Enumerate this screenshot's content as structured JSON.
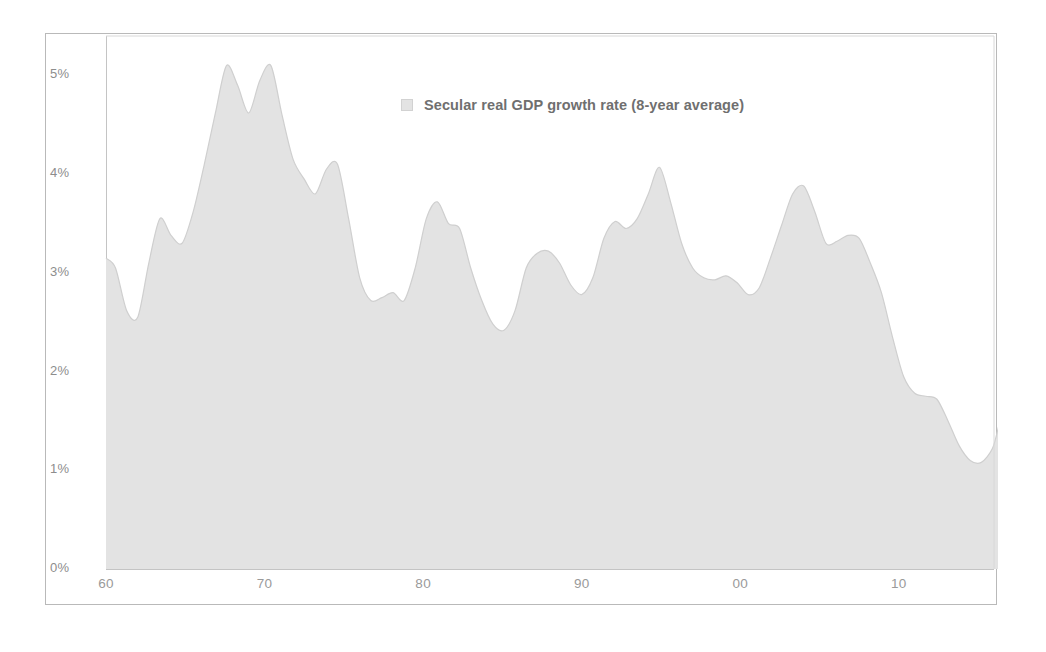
{
  "chart_data": {
    "type": "area",
    "title": "",
    "subtitle": "",
    "xlabel": "",
    "ylabel": "",
    "legend": [
      {
        "name": "Secular real GDP growth rate (8-year average)",
        "color": "#e3e3e3"
      }
    ],
    "legend_position": "top-center",
    "grid": false,
    "series_name": "Secular real GDP growth rate (8-year average)",
    "fill_color": "#e3e3e3",
    "line_color": "#cfcfcf",
    "axis_color": "#c4c4c4",
    "tick_label_color": "#9a9a9a",
    "xlim": [
      1960,
      2016
    ],
    "ylim": [
      0,
      5.4
    ],
    "y_ticks": [
      0,
      1,
      2,
      3,
      4,
      5
    ],
    "y_tick_labels": [
      "0%",
      "1%",
      "2%",
      "3%",
      "4%",
      "5%"
    ],
    "x_ticks": [
      1960,
      1970,
      1980,
      1990,
      2000,
      2010
    ],
    "x_tick_labels": [
      "60",
      "70",
      "80",
      "90",
      "00",
      "10"
    ],
    "x": [
      1960.0,
      1960.6,
      1961.3,
      1962.0,
      1962.7,
      1963.4,
      1964.1,
      1964.8,
      1965.5,
      1966.2,
      1966.9,
      1967.6,
      1968.3,
      1969.0,
      1969.7,
      1970.4,
      1971.1,
      1971.8,
      1972.5,
      1973.2,
      1973.9,
      1974.6,
      1975.3,
      1976.0,
      1976.7,
      1977.4,
      1978.1,
      1978.8,
      1979.5,
      1980.2,
      1980.9,
      1981.6,
      1982.3,
      1983.0,
      1983.7,
      1984.4,
      1985.1,
      1985.8,
      1986.5,
      1987.2,
      1987.9,
      1988.6,
      1989.3,
      1990.0,
      1990.7,
      1991.4,
      1992.1,
      1992.8,
      1993.5,
      1994.2,
      1994.9,
      1995.6,
      1996.3,
      1997.0,
      1997.7,
      1998.4,
      1999.1,
      1999.8,
      2000.5,
      2001.2,
      2001.9,
      2002.6,
      2003.3,
      2004.0,
      2004.7,
      2005.4,
      2006.1,
      2006.8,
      2007.5,
      2008.2,
      2008.9,
      2009.6,
      2010.3,
      2011.0,
      2011.7,
      2012.4,
      2013.1,
      2013.8,
      2014.5,
      2015.2,
      2015.9,
      2016.3
    ],
    "y": [
      3.15,
      3.05,
      2.62,
      2.55,
      3.1,
      3.55,
      3.38,
      3.3,
      3.62,
      4.1,
      4.62,
      5.1,
      4.9,
      4.62,
      4.95,
      5.1,
      4.6,
      4.15,
      3.95,
      3.8,
      4.05,
      4.1,
      3.55,
      2.95,
      2.72,
      2.75,
      2.8,
      2.72,
      3.05,
      3.55,
      3.72,
      3.5,
      3.45,
      3.05,
      2.72,
      2.48,
      2.42,
      2.62,
      3.05,
      3.2,
      3.22,
      3.1,
      2.88,
      2.78,
      2.95,
      3.35,
      3.52,
      3.45,
      3.55,
      3.8,
      4.07,
      3.72,
      3.3,
      3.05,
      2.95,
      2.93,
      2.97,
      2.9,
      2.78,
      2.85,
      3.15,
      3.48,
      3.8,
      3.88,
      3.62,
      3.3,
      3.32,
      3.38,
      3.35,
      3.1,
      2.8,
      2.35,
      1.95,
      1.78,
      1.75,
      1.72,
      1.5,
      1.25,
      1.1,
      1.08,
      1.22,
      1.45
    ]
  },
  "legend": {
    "label": "Secular real GDP growth rate (8-year average)",
    "swatch_name": "legend-swatch"
  }
}
